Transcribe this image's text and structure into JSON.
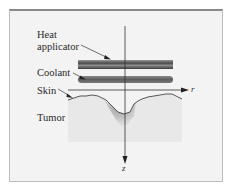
{
  "diagram": {
    "labels": {
      "heat_line1": "Heat",
      "heat_line2": "applicator",
      "coolant": "Coolant",
      "skin": "Skin",
      "tumor": "Tumor"
    },
    "axes": {
      "r": "r",
      "z": "z"
    },
    "colors": {
      "background": "#f3f3f3",
      "frame_border": "#8a8a8a",
      "heat_applicator": "#5a5a5a",
      "coolant": "#6e6e6e",
      "tissue": "#e6e6e6",
      "tumor": "#b5b5b5"
    }
  }
}
